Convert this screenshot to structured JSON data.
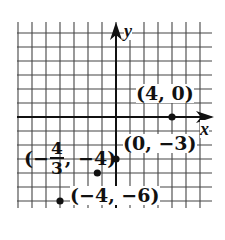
{
  "chart_data": {
    "type": "scatter",
    "title": "",
    "xlabel": "x",
    "ylabel": "y",
    "xlim": [
      -7,
      7
    ],
    "ylim": [
      -6.6,
      6.7
    ],
    "grid": true,
    "legend": null,
    "points": [
      {
        "x": 4,
        "y": 0,
        "label": "(4, 0)"
      },
      {
        "x": 0,
        "y": -3,
        "label": "(0, −3)"
      },
      {
        "x": -1.3333,
        "y": -4,
        "label": "(−4/3, −4)"
      },
      {
        "x": -4,
        "y": -6,
        "label": "(−4, −6)"
      }
    ],
    "annotations": {
      "p1": "(4, 0)",
      "p2": "(0, −3)",
      "p3_prefix": "(−",
      "p3_num": "4",
      "p3_den": "3",
      "p3_suffix": ", −4)",
      "p4": "(−4, −6)"
    }
  },
  "axes": {
    "x_label": "x",
    "y_label": "y"
  },
  "colors": {
    "ink": "#111111",
    "grid": "#444444",
    "background": "#ffffff"
  }
}
